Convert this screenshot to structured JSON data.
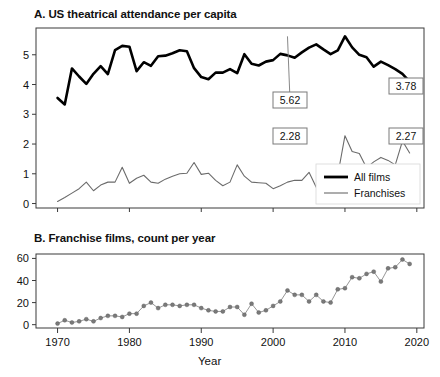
{
  "figure": {
    "panelA_title": "A. US theatrical attendance per capita",
    "panelB_title": "B. Franchise films, count per year",
    "xaxis_title": "Year",
    "colors": {
      "all_films": "#000000",
      "franchises": "#6b6b6b",
      "marker": "#7a7a7a",
      "axis": "#3a3a3a",
      "callout_border": "#7a7a7a",
      "background": "#ffffff"
    }
  },
  "chart_data": [
    {
      "type": "line",
      "title": "A. US theatrical attendance per capita",
      "xlabel": "",
      "ylabel": "",
      "xlim": [
        1967,
        2021
      ],
      "ylim": [
        -0.15,
        5.9
      ],
      "grid": false,
      "legend_position": "bottom-right",
      "xticks": [
        1970,
        1980,
        1990,
        2000,
        2010,
        2020
      ],
      "xticklabels": [
        "1970",
        "1980",
        "1990",
        "2000",
        "2010",
        "2020"
      ],
      "yticks": [
        0,
        1,
        2,
        3,
        4,
        5
      ],
      "yticklabels": [
        "0",
        "1",
        "2",
        "3",
        "4",
        "5"
      ],
      "x": [
        1970,
        1971,
        1972,
        1973,
        1974,
        1975,
        1976,
        1977,
        1978,
        1979,
        1980,
        1981,
        1982,
        1983,
        1984,
        1985,
        1986,
        1987,
        1988,
        1989,
        1990,
        1991,
        1992,
        1993,
        1994,
        1995,
        1996,
        1997,
        1998,
        1999,
        2000,
        2001,
        2002,
        2003,
        2004,
        2005,
        2006,
        2007,
        2008,
        2009,
        2010,
        2011,
        2012,
        2013,
        2014,
        2015,
        2016,
        2017,
        2018,
        2019
      ],
      "series": [
        {
          "name": "All films",
          "color": "#000000",
          "linewidth": 2.6,
          "values": [
            3.55,
            3.33,
            4.54,
            4.27,
            4.02,
            4.36,
            4.62,
            4.35,
            5.16,
            5.3,
            5.27,
            4.45,
            4.75,
            4.63,
            4.95,
            4.97,
            5.05,
            5.15,
            5.12,
            4.55,
            4.25,
            4.18,
            4.4,
            4.4,
            4.52,
            4.38,
            5.02,
            4.7,
            4.64,
            4.77,
            4.82,
            5.03,
            4.98,
            4.9,
            5.08,
            5.24,
            5.35,
            5.18,
            5.02,
            5.15,
            5.62,
            5.25,
            5.0,
            4.92,
            4.6,
            4.77,
            4.65,
            4.52,
            4.36,
            4.1,
            4.25,
            4.35,
            4.12,
            4.1,
            4.05,
            4.15,
            3.95,
            3.9,
            3.78
          ]
        },
        {
          "name": "Franchises",
          "color": "#6b6b6b",
          "linewidth": 1.1,
          "values": [
            0.07,
            0.2,
            0.35,
            0.5,
            0.72,
            0.43,
            0.62,
            0.72,
            0.72,
            1.22,
            0.68,
            0.85,
            0.95,
            0.72,
            0.68,
            0.82,
            0.92,
            1.0,
            1.02,
            1.38,
            0.98,
            1.02,
            0.78,
            0.6,
            0.72,
            1.3,
            0.92,
            0.72,
            0.7,
            0.68,
            0.5,
            0.6,
            0.72,
            0.78,
            0.78,
            1.05,
            0.55,
            0.78,
            1.22,
            0.95,
            2.28,
            1.75,
            1.68,
            1.2,
            1.4,
            1.55,
            1.45,
            1.3,
            2.1,
            1.7,
            1.65,
            1.95,
            2.1,
            2.2,
            2.0,
            2.12,
            2.3,
            2.4,
            2.38,
            2.27
          ]
        }
      ],
      "annotations": [
        {
          "label": "5.62",
          "series": "All films",
          "x": 2002,
          "y": 5.62
        },
        {
          "label": "3.78",
          "series": "All films",
          "x": 2019,
          "y": 3.78
        },
        {
          "label": "2.28",
          "series": "Franchises",
          "x": 2002,
          "y": 2.28
        },
        {
          "label": "2.27",
          "series": "Franchises",
          "x": 2019,
          "y": 2.27
        }
      ],
      "legend": [
        {
          "label": "All films",
          "color": "#000000",
          "linewidth": 2.8
        },
        {
          "label": "Franchises",
          "color": "#6b6b6b",
          "linewidth": 1.1
        }
      ]
    },
    {
      "type": "scatter",
      "title": "B. Franchise films, count per year",
      "xlabel": "Year",
      "ylabel": "",
      "xlim": [
        1967,
        2021
      ],
      "ylim": [
        -3,
        64
      ],
      "grid": false,
      "xticks": [
        1970,
        1980,
        1990,
        2000,
        2010,
        2020
      ],
      "xticklabels": [
        "1970",
        "1980",
        "1990",
        "2000",
        "2010",
        "2020"
      ],
      "yticks": [
        0,
        20,
        40,
        60
      ],
      "yticklabels": [
        "0",
        "20",
        "40",
        "60"
      ],
      "marker_color": "#7a7a7a",
      "line_color": "#8a8a8a",
      "x": [
        1970,
        1971,
        1972,
        1973,
        1974,
        1975,
        1976,
        1977,
        1978,
        1979,
        1980,
        1981,
        1982,
        1983,
        1984,
        1985,
        1986,
        1987,
        1988,
        1989,
        1990,
        1991,
        1992,
        1993,
        1994,
        1995,
        1996,
        1997,
        1998,
        1999,
        2000,
        2001,
        2002,
        2003,
        2004,
        2005,
        2006,
        2007,
        2008,
        2009,
        2010,
        2011,
        2012,
        2013,
        2014,
        2015,
        2016,
        2017,
        2018,
        2019
      ],
      "values": [
        1,
        4,
        2,
        3,
        5,
        3,
        6,
        8,
        8,
        7,
        10,
        10,
        17,
        20,
        15,
        18,
        18,
        17,
        18,
        18,
        15,
        13,
        12,
        12,
        16,
        16,
        9,
        19,
        11,
        13,
        17,
        21,
        31,
        27,
        27,
        21,
        27,
        21,
        20,
        32,
        33,
        43,
        42,
        46,
        48,
        39,
        51,
        52,
        59,
        55
      ]
    }
  ]
}
